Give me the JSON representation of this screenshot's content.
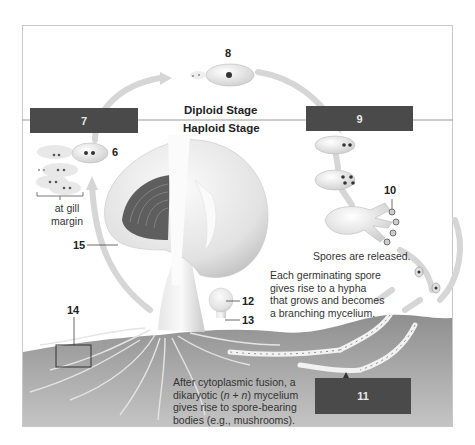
{
  "diagram": {
    "stages": {
      "diploid_label": "Diploid Stage",
      "haploid_label": "Haploid Stage"
    },
    "answer_boxes": [
      {
        "id": "box-7",
        "label": "7"
      },
      {
        "id": "box-9",
        "label": "9"
      },
      {
        "id": "box-11",
        "label": "11"
      }
    ],
    "callouts": [
      {
        "id": "6",
        "label": "6"
      },
      {
        "id": "8",
        "label": "8"
      },
      {
        "id": "10",
        "label": "10"
      },
      {
        "id": "12",
        "label": "12"
      },
      {
        "id": "13",
        "label": "13"
      },
      {
        "id": "14",
        "label": "14"
      },
      {
        "id": "15",
        "label": "15"
      }
    ],
    "captions": {
      "gill_margin_line1": "at gill",
      "gill_margin_line2": "margin",
      "spores_released": "Spores are released.",
      "germinating_1": "Each germinating spore",
      "germinating_2": "gives rise to a hypha",
      "germinating_3": "that grows and becomes",
      "germinating_4": "a  branching mycelium.",
      "fusion_1": "After cytoplasmic fusion, a",
      "fusion_2a": "dikaryotic (",
      "fusion_2n1": "n",
      "fusion_2b": " + ",
      "fusion_2n2": "n",
      "fusion_2c": ") mycelium",
      "fusion_3": "gives rise to spore-bearing",
      "fusion_4": "bodies (e.g., mushrooms)."
    },
    "colors": {
      "answer_box": "#4a4a4a",
      "arrow": "#d4d4d4",
      "soil": "#9a9a9a",
      "cell_fill": "#ececec",
      "nucleus": "#3a3a3a",
      "gill": "#5e5e5e"
    }
  }
}
